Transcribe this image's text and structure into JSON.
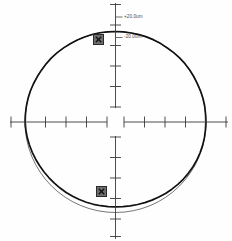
{
  "chart_data": {
    "type": "line",
    "subtype": "polar-roundness-profile",
    "title": "",
    "xlabel": "",
    "ylabel": "",
    "grid": false,
    "legend": false,
    "center": {
      "x": 115.5,
      "y": 122.0
    },
    "radius_px": 90.5,
    "scale_labels": [
      {
        "id": "upper",
        "text": "+20.0um",
        "value": 20.0,
        "unit": "um",
        "x": 124,
        "y": 14.5
      },
      {
        "id": "lower",
        "text": "-20.0um",
        "value": -20.0,
        "unit": "um",
        "x": 124,
        "y": 35.0
      }
    ],
    "axes": {
      "vertical": {
        "x": 115.5,
        "top_segment": [
          2,
          108
        ],
        "bottom_segment": [
          136,
          239
        ],
        "tick_half_width": 5.5,
        "tick_spacing_px": 20.5,
        "ticks_up": [
          107.0,
          86.5,
          66.0,
          45.5,
          25.0,
          4.5
        ],
        "ticks_down": [
          137.0,
          157.5,
          178.0,
          198.5,
          219.0,
          236.0
        ]
      },
      "horizontal": {
        "y": 122.0,
        "left_segment": [
          10,
          107
        ],
        "right_segment": [
          124,
          228
        ],
        "tick_half_height": 5.5,
        "tick_spacing_px": 20.5,
        "ticks_left": [
          107.0,
          86.5,
          66.0,
          45.5,
          25.0,
          11.0
        ],
        "ticks_right": [
          124.0,
          144.5,
          165.0,
          185.5,
          206.0,
          226.0
        ]
      }
    },
    "series": [
      {
        "name": "reference-circle",
        "role": "least-squares-reference-circle",
        "style": "thin",
        "color": "#1a1a1a",
        "width_px": 0.6,
        "cx": 115.5,
        "cy": 122.0,
        "r": 90.5
      },
      {
        "name": "measured-profile",
        "role": "measured-roundness-trace",
        "style": "thick",
        "color": "#111111",
        "width_px": 1.7,
        "note": "profile deviates inward (upward) from the reference circle across the lower arc; maximum deviation near bottom",
        "deviation_um": {
          "max_inward": 6.0,
          "max_outward": 1.0,
          "at_angle_deg": 270
        },
        "samples_deg_radius_px": [
          [
            0,
            90.3
          ],
          [
            5,
            90.4
          ],
          [
            10,
            90.6
          ],
          [
            15,
            90.6
          ],
          [
            20,
            90.5
          ],
          [
            25,
            90.4
          ],
          [
            30,
            90.5
          ],
          [
            35,
            90.6
          ],
          [
            40,
            90.7
          ],
          [
            45,
            90.6
          ],
          [
            50,
            90.5
          ],
          [
            55,
            90.4
          ],
          [
            60,
            90.5
          ],
          [
            65,
            90.6
          ],
          [
            70,
            90.6
          ],
          [
            75,
            90.5
          ],
          [
            80,
            90.4
          ],
          [
            85,
            90.4
          ],
          [
            90,
            90.5
          ],
          [
            95,
            90.5
          ],
          [
            100,
            90.6
          ],
          [
            105,
            90.6
          ],
          [
            110,
            90.5
          ],
          [
            115,
            90.4
          ],
          [
            120,
            90.4
          ],
          [
            125,
            90.5
          ],
          [
            130,
            90.6
          ],
          [
            135,
            90.6
          ],
          [
            140,
            90.5
          ],
          [
            145,
            90.4
          ],
          [
            150,
            90.4
          ],
          [
            155,
            90.5
          ],
          [
            160,
            90.6
          ],
          [
            165,
            90.6
          ],
          [
            170,
            90.5
          ],
          [
            175,
            90.4
          ],
          [
            180,
            90.3
          ],
          [
            185,
            90.0
          ],
          [
            190,
            89.6
          ],
          [
            195,
            89.1
          ],
          [
            200,
            88.6
          ],
          [
            205,
            88.1
          ],
          [
            210,
            87.6
          ],
          [
            215,
            87.2
          ],
          [
            220,
            86.8
          ],
          [
            225,
            86.5
          ],
          [
            230,
            86.2
          ],
          [
            235,
            86.0
          ],
          [
            240,
            85.8
          ],
          [
            245,
            85.6
          ],
          [
            250,
            85.4
          ],
          [
            255,
            85.2
          ],
          [
            260,
            85.0
          ],
          [
            265,
            84.9
          ],
          [
            270,
            84.8
          ],
          [
            275,
            84.9
          ],
          [
            280,
            85.1
          ],
          [
            285,
            85.4
          ],
          [
            290,
            85.8
          ],
          [
            295,
            86.2
          ],
          [
            300,
            86.7
          ],
          [
            305,
            87.2
          ],
          [
            310,
            87.7
          ],
          [
            315,
            88.2
          ],
          [
            320,
            88.7
          ],
          [
            325,
            89.1
          ],
          [
            330,
            89.5
          ],
          [
            335,
            89.8
          ],
          [
            340,
            90.0
          ],
          [
            345,
            90.2
          ],
          [
            350,
            90.3
          ],
          [
            355,
            90.3
          ]
        ]
      }
    ],
    "markers": [
      {
        "id": "marker-upper",
        "glyph": "x-in-box",
        "x": 98.5,
        "y": 39.5,
        "size_px": 11
      },
      {
        "id": "marker-lower",
        "glyph": "x-in-box",
        "x": 101.5,
        "y": 191.5,
        "size_px": 11
      }
    ]
  },
  "colors": {
    "background": "#fefefe",
    "profile": "#111111",
    "reference": "#1a1a1a",
    "axis": "#3a3a3a",
    "label_text": "#4a4a4a",
    "marker_fill": "#6e6e6e",
    "marker_stroke": "#2a2a2a"
  },
  "icons": {
    "marker": "x-in-box-icon"
  }
}
